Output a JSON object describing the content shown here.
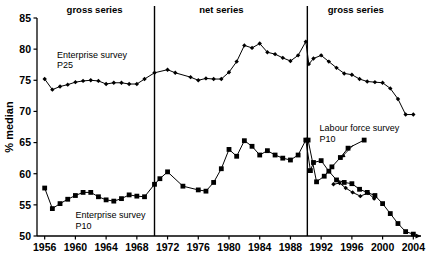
{
  "chart_data": {
    "type": "line",
    "title": "",
    "xlabel": "",
    "ylabel": "% median",
    "xlim": [
      1955,
      2005
    ],
    "ylim": [
      50,
      85
    ],
    "ytick_labels": [
      "50",
      "55",
      "60",
      "65",
      "70",
      "75",
      "80",
      "85"
    ],
    "yticks": [
      50,
      55,
      60,
      65,
      70,
      75,
      80,
      85
    ],
    "xtick_labels": [
      "1956",
      "1960",
      "1964",
      "1968",
      "1972",
      "1976",
      "1980",
      "1984",
      "1988",
      "1992",
      "1996",
      "2000",
      "2004"
    ],
    "xticks": [
      1956,
      1960,
      1964,
      1968,
      1972,
      1976,
      1980,
      1984,
      1988,
      1992,
      1996,
      2000,
      2004
    ],
    "grid": false,
    "legend_position": "inline-annotations",
    "section_labels": [
      {
        "text": "gross series",
        "x": 1962.5
      },
      {
        "text": "net series",
        "x": 1979.0
      },
      {
        "text": "gross series",
        "x": 1996.5
      }
    ],
    "dividers": [
      1970.3,
      1990.2
    ],
    "annotations": [
      {
        "text": "Enterprise survey",
        "x": 1957.6,
        "y": 78.6
      },
      {
        "text": "P25",
        "x": 1957.6,
        "y": 76.9
      },
      {
        "text": "Enterprise survey",
        "x": 1960.0,
        "y": 52.9
      },
      {
        "text": "P10",
        "x": 1960.0,
        "y": 51.2
      },
      {
        "text": "Labour force survey",
        "x": 1991.8,
        "y": 66.8
      },
      {
        "text": "P10",
        "x": 1991.8,
        "y": 65.1
      }
    ],
    "arrow": {
      "x1": 1996.2,
      "y1": 64.6,
      "x2": 1994.6,
      "y2": 62.6
    },
    "series": [
      {
        "name": "Enterprise survey P25",
        "marker": "diamond",
        "x": [
          1956,
          1957,
          1958,
          1959,
          1960,
          1961,
          1962,
          1963,
          1964,
          1965,
          1966,
          1967,
          1968,
          1969,
          1970.3,
          1972,
          1973,
          1975,
          1976,
          1977,
          1978,
          1979,
          1980,
          1981,
          1982,
          1983,
          1984,
          1985,
          1986,
          1987,
          1988,
          1989,
          1990.0,
          1990.4,
          1991,
          1992,
          1993,
          1994,
          1995,
          1996,
          1997,
          1998,
          1999,
          2000,
          2001,
          2002,
          2003,
          2004
        ],
        "values": [
          75.2,
          73.5,
          74.0,
          74.3,
          74.7,
          74.9,
          75.0,
          74.9,
          74.4,
          74.6,
          74.6,
          74.4,
          74.4,
          75.2,
          76.2,
          76.7,
          76.2,
          75.5,
          75.0,
          75.3,
          75.2,
          75.2,
          76.3,
          78.0,
          80.6,
          80.2,
          80.9,
          79.5,
          79.2,
          78.6,
          78.1,
          79.0,
          81.2,
          77.6,
          78.5,
          79.0,
          78.0,
          77.0,
          76.1,
          75.9,
          75.2,
          74.8,
          74.7,
          74.6,
          73.7,
          72.0,
          69.5,
          69.5
        ]
      },
      {
        "name": "Enterprise survey P10 / net series P10",
        "marker": "square",
        "x": [
          1956,
          1957,
          1958,
          1959,
          1960,
          1961,
          1962,
          1963,
          1964,
          1965,
          1966,
          1967,
          1968,
          1969,
          1970.3,
          1971,
          1972,
          1974,
          1976,
          1977,
          1978,
          1979,
          1980,
          1981,
          1982,
          1983,
          1984,
          1985,
          1986,
          1987,
          1988,
          1989,
          1990.0,
          1990.6,
          1991,
          1992,
          1993,
          1994,
          1995,
          1996,
          1997,
          1998,
          1999,
          2000,
          2001,
          2002,
          2003,
          2004
        ],
        "values": [
          57.7,
          54.4,
          55.2,
          55.9,
          56.5,
          57.0,
          57.0,
          56.3,
          55.8,
          55.6,
          56.0,
          56.6,
          56.4,
          56.3,
          58.3,
          59.2,
          60.3,
          58.0,
          57.4,
          57.2,
          58.6,
          60.8,
          63.9,
          62.8,
          65.3,
          64.4,
          63.0,
          63.7,
          63.0,
          62.5,
          62.2,
          63.0,
          65.4,
          60.5,
          61.8,
          62.1,
          60.4,
          59.0,
          58.6,
          58.4,
          57.5,
          57.0,
          56.5,
          55.2,
          53.6,
          52.0,
          50.7,
          50.3
        ]
      },
      {
        "name": "Labour force survey P10",
        "marker": "square",
        "x": [
          1990.3,
          1991.4,
          1992.4,
          1993.4,
          1994.5,
          1995.5,
          1997.6
        ],
        "values": [
          65.4,
          58.7,
          59.6,
          61.1,
          62.6,
          64.1,
          65.4
        ]
      },
      {
        "name": "Labour force survey P25 lower branch",
        "marker": "diamond",
        "x": [
          1993.6,
          1994.4,
          1995.2,
          1996.1,
          1997.1,
          1998.1,
          1998.9
        ],
        "values": [
          58.3,
          58.5,
          57.7,
          57.0,
          56.4,
          56.9,
          56.0
        ]
      }
    ]
  }
}
